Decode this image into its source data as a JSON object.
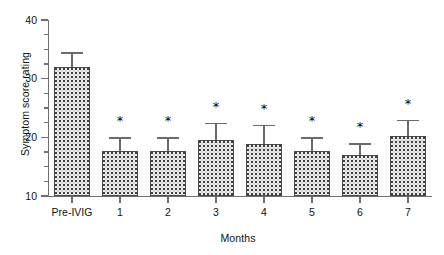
{
  "chart_data": {
    "type": "bar",
    "title": "",
    "xlabel": "Months",
    "ylabel": "Symptom score rating",
    "categories": [
      "Pre-IVIG",
      "1",
      "2",
      "3",
      "4",
      "5",
      "6",
      "7"
    ],
    "values": [
      32.0,
      17.6,
      17.6,
      19.5,
      18.8,
      17.6,
      17.0,
      20.2
    ],
    "errors": [
      2.5,
      2.4,
      2.4,
      3.0,
      3.3,
      2.4,
      2.0,
      2.8
    ],
    "annotations": [
      "",
      "*",
      "*",
      "*",
      "*",
      "*",
      "*",
      "*"
    ],
    "ylim": [
      10,
      40
    ],
    "yticks_major": [
      10,
      20,
      30,
      40
    ],
    "yticks_minor": [
      12.5,
      15,
      17.5,
      22.5,
      25,
      27.5,
      32.5,
      35,
      37.5
    ],
    "ytick_labels": [
      "10",
      "20",
      "30",
      "40"
    ],
    "grid": false,
    "legend": false,
    "error_bar_style": "upper-only-with-caps",
    "bar_fill": "stippled-dot-pattern",
    "colors": {
      "bar_fill": "#ececec",
      "bar_edge": "#4a4a4a",
      "axis": "#6f6f6f",
      "text": "#111111"
    }
  },
  "axes": {
    "y_title": "Symptom score rating",
    "x_title": "Months"
  }
}
